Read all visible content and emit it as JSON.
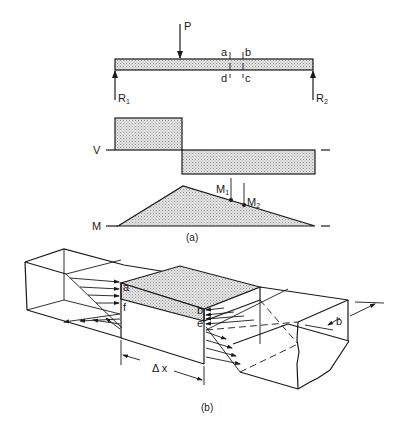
{
  "figure": {
    "part_a": {
      "caption": "(a)",
      "beam": {
        "load_label": "P",
        "reaction_left": {
          "main": "R",
          "sub": "1"
        },
        "reaction_right": {
          "main": "R",
          "sub": "2"
        },
        "cut_labels": {
          "top_left": "a",
          "top_right": "b",
          "bottom_left": "d",
          "bottom_right": "c"
        }
      },
      "shear_diagram": {
        "label": "V"
      },
      "moment_diagram": {
        "label": "M",
        "point1": {
          "main": "M",
          "sub": "1"
        },
        "point2": {
          "main": "M",
          "sub": "2"
        }
      }
    },
    "part_b": {
      "caption": "(b)",
      "corner_labels": {
        "a": "a",
        "b": "b",
        "e": "e",
        "f": "f"
      },
      "dimension_length": "Δ x",
      "dimension_width": "b"
    }
  }
}
